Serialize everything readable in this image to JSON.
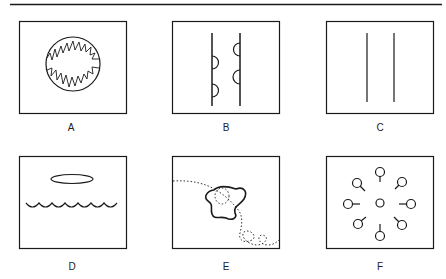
{
  "figure": {
    "top_rule": true,
    "stroke_color": "#1a1a1a",
    "background": "#ffffff",
    "panels": [
      {
        "id": "A",
        "label": "A",
        "content": "circle-with-jagged-inner-edge"
      },
      {
        "id": "B",
        "label": "B",
        "content": "two-vertical-lines-with-semicircular-bulges"
      },
      {
        "id": "C",
        "label": "C",
        "content": "two-parallel-vertical-lines"
      },
      {
        "id": "D",
        "label": "D",
        "content": "ellipse-above-scalloped-line"
      },
      {
        "id": "E",
        "label": "E",
        "content": "amoeboid-shape-with-dotted-track"
      },
      {
        "id": "F",
        "label": "F",
        "content": "radial-ring-of-tailed-circles"
      }
    ]
  }
}
